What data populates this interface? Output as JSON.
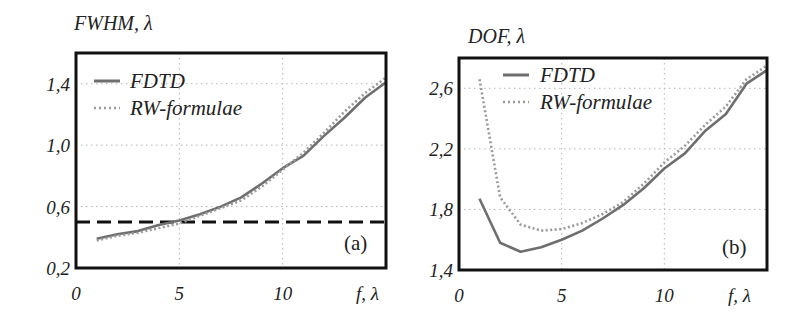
{
  "chart_data": [
    {
      "type": "line",
      "panel_label": "(a)",
      "title": "FWHM, λ",
      "ylabel": "FWHM, λ",
      "xlabel": "f, λ",
      "xlim": [
        0,
        15
      ],
      "ylim": [
        0.2,
        1.6
      ],
      "x_ticks": [
        0,
        5,
        10
      ],
      "x_tick_labels": [
        "0",
        "5",
        "10"
      ],
      "y_ticks": [
        0.2,
        0.6,
        1.0,
        1.4
      ],
      "y_tick_labels": [
        "0,2",
        "0,6",
        "1,0",
        "1,4"
      ],
      "grid": true,
      "legend_position": "upper left",
      "x": [
        1,
        2,
        3,
        4,
        5,
        6,
        7,
        8,
        9,
        10,
        11,
        12,
        13,
        14,
        15
      ],
      "series": [
        {
          "name": "FDTD",
          "style": "solid",
          "color": "#6e6e6e",
          "values": [
            0.39,
            0.42,
            0.44,
            0.48,
            0.51,
            0.55,
            0.6,
            0.66,
            0.75,
            0.85,
            0.93,
            1.06,
            1.18,
            1.31,
            1.41
          ]
        },
        {
          "name": "RW-formulae",
          "style": "dotted",
          "color": "#9a9a9a",
          "values": [
            0.38,
            0.41,
            0.43,
            0.46,
            0.49,
            0.54,
            0.59,
            0.64,
            0.73,
            0.84,
            0.95,
            1.08,
            1.22,
            1.34,
            1.44
          ]
        }
      ],
      "reference_line": {
        "y": 0.5,
        "style": "dashed",
        "color": "#111111"
      }
    },
    {
      "type": "line",
      "panel_label": "(b)",
      "title": "DOF, λ",
      "ylabel": "DOF, λ",
      "xlabel": "f, λ",
      "xlim": [
        0,
        15
      ],
      "ylim": [
        1.4,
        2.8
      ],
      "x_ticks": [
        0,
        5,
        10
      ],
      "x_tick_labels": [
        "0",
        "5",
        "10"
      ],
      "y_ticks": [
        1.4,
        1.8,
        2.2,
        2.6
      ],
      "y_tick_labels": [
        "1,4",
        "1,8",
        "2,2",
        "2,6"
      ],
      "grid": true,
      "legend_position": "upper left",
      "x": [
        1,
        2,
        3,
        4,
        5,
        6,
        7,
        8,
        9,
        10,
        11,
        12,
        13,
        14,
        15
      ],
      "series": [
        {
          "name": "FDTD",
          "style": "solid",
          "color": "#6e6e6e",
          "values": [
            1.87,
            1.58,
            1.52,
            1.55,
            1.6,
            1.66,
            1.74,
            1.83,
            1.94,
            2.07,
            2.17,
            2.32,
            2.43,
            2.63,
            2.72
          ]
        },
        {
          "name": "RW-formulae",
          "style": "dotted",
          "color": "#9a9a9a",
          "values": [
            2.66,
            1.88,
            1.7,
            1.66,
            1.67,
            1.71,
            1.77,
            1.85,
            1.97,
            2.11,
            2.22,
            2.36,
            2.48,
            2.66,
            2.75
          ]
        }
      ]
    }
  ],
  "layout": {
    "panels": [
      {
        "left": 76,
        "right": 386,
        "top": 53,
        "bottom": 268
      },
      {
        "left": 459,
        "right": 767,
        "top": 58,
        "bottom": 270
      }
    ]
  }
}
